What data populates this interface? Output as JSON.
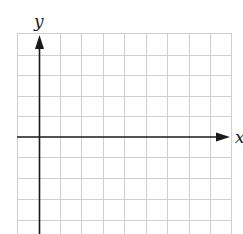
{
  "figure": {
    "type": "coordinate-grid",
    "x_axis_label": "x",
    "y_axis_label": "y",
    "grid": {
      "columns": 10,
      "rows_visible": 10,
      "cell_size_px": 21.4,
      "line_color": "#c8c8c8",
      "axis_color": "#1a1a1a"
    },
    "origin": {
      "column": 1,
      "row": 5
    }
  }
}
